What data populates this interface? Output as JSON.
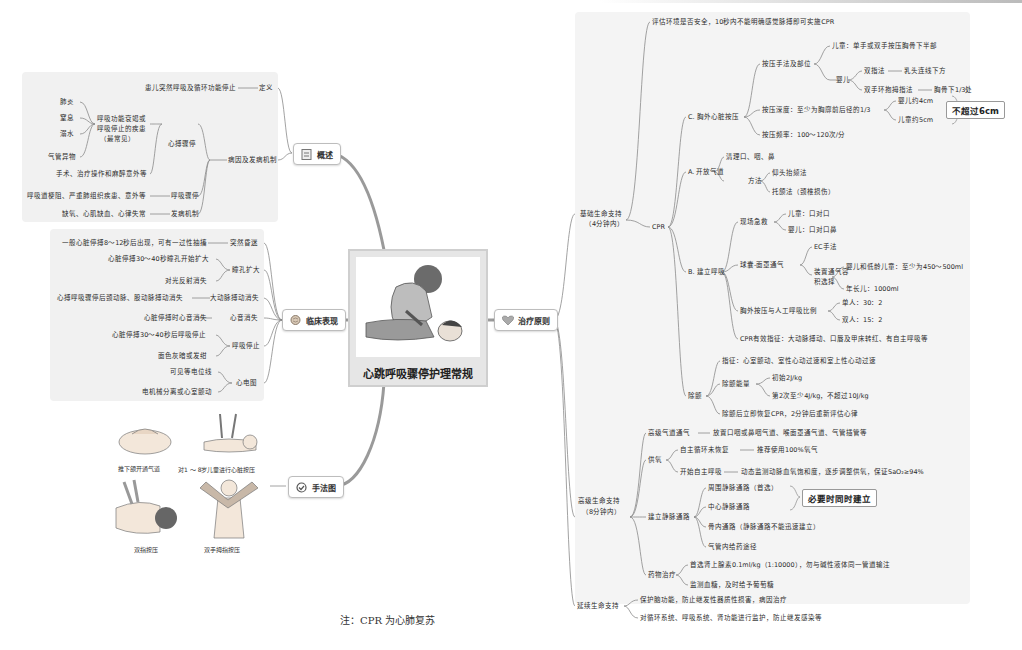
{
  "center": {
    "title": "心跳呼吸骤停护理常规",
    "image": "cpr-illustration"
  },
  "branches": {
    "overview": {
      "label": "概述",
      "icon": "document-icon",
      "definition": {
        "label": "定义",
        "text": "患儿突然呼吸及循环功能停止"
      },
      "etiology": {
        "label": "病因及发病机制",
        "cardiac_arrest": {
          "label": "心搏骤停",
          "group_label": [
            "呼吸功能衰竭或",
            "呼吸停止的疾患",
            "（最常见）"
          ],
          "items": [
            "肺炎",
            "窒息",
            "溺水",
            "气管异物"
          ],
          "other": "手术、治疗操作和麻醉意外等"
        },
        "respiratory_arrest": {
          "label": "呼吸骤停",
          "text": "呼吸道梗阻、严重肺组织疾患、意外等"
        },
        "mechanism": {
          "label": "发病机制",
          "text": "缺氧、心肌缺血、心律失常"
        }
      }
    },
    "clinical": {
      "label": "临床表现",
      "icon": "brain-icon",
      "items": [
        {
          "label": "突然昏迷",
          "children": [
            "一般心脏停搏8～12秒后出现，可有一过性抽搐"
          ]
        },
        {
          "label": "瞳孔扩大",
          "children": [
            "心脏停搏30～40秒瞳孔开始扩大",
            "对光反射消失"
          ]
        },
        {
          "label": "大动脉搏动消失",
          "children": [
            "心搏呼吸骤停后颈动脉、股动脉搏动消失"
          ]
        },
        {
          "label": "心音消失",
          "children": [
            "心脏停搏时心音消失"
          ]
        },
        {
          "label": "呼吸停止",
          "children": [
            "心脏停搏30～40秒后呼吸停止",
            "面色灰暗或发绀"
          ]
        },
        {
          "label": "心电图",
          "children": [
            "可见等电位线",
            "电机械分离或心室颤动"
          ]
        }
      ]
    },
    "diagrams": {
      "label": "手法图",
      "icon": "check-circle-icon",
      "figures": [
        "推下颌开通气道",
        "对1 ～ 8岁儿童进行心脏按压",
        "双指按压",
        "双手拇指按压"
      ]
    },
    "treatment": {
      "label": "治疗原则",
      "icon": "heart-icon",
      "bls": {
        "label": [
          "基础生命支持",
          "（4分钟内）"
        ],
        "assess": "评估环境是否安全，10秒内不能明确感觉脉搏即可实施CPR",
        "cpr": {
          "label": "CPR",
          "C": {
            "label": "C. 胸外心脏按压",
            "technique": {
              "label": "按压手法及部位",
              "child": "儿童：单手或双手按压胸骨下半部",
              "infant": {
                "label": "婴儿",
                "two_finger": {
                  "label": "双指法",
                  "text": "乳头连线下方"
                },
                "two_thumb": {
                  "label": "双手环抱拇指法",
                  "text": "胸骨下1/3处"
                }
              }
            },
            "depth": {
              "label": "按压深度：至少为胸廓前后径的1/3",
              "infant": "婴儿约4cm",
              "child": "儿童约5cm",
              "max": "不超过6cm"
            },
            "rate": "按压频率：100～120次/分"
          },
          "A": {
            "label": "A. 开放气道",
            "clear": "清理口、咽、鼻",
            "method": {
              "label": "方法",
              "items": [
                "仰头抬颏法",
                "托颌法（颈椎损伤）"
              ]
            }
          },
          "B": {
            "label": "B. 建立呼吸",
            "onsite": {
              "label": "现场急救",
              "items": [
                "儿童：口对口",
                "婴儿：口对口鼻"
              ]
            },
            "bag": {
              "label": "球囊-面罩通气",
              "ec": "EC手法",
              "volume": {
                "label": [
                  "装置通气容",
                  "积选择"
                ],
                "items": [
                  "婴儿和低龄儿童：至少为450～500ml",
                  "年长儿：1000ml"
                ]
              }
            },
            "ratio": {
              "label": "胸外按压与人工呼吸比例",
              "items": [
                "单人：30：2",
                "双人：15：2"
              ]
            },
            "effective": "CPR有效指征：大动脉搏动、口唇及甲床转红、有自主呼吸等"
          },
          "defib": {
            "label": "除颤",
            "indication": "指征：心室颤动、室性心动过速和室上性心动过速",
            "energy": {
              "label": "除颤能量",
              "items": [
                "初始2J/kg",
                "第2次至少4J/kg，不超过10J/kg"
              ]
            },
            "after": "除颤后立即恢复CPR，2分钟后重新评估心律"
          }
        }
      },
      "als": {
        "label": [
          "高级生命支持",
          "（8分钟内）"
        ],
        "airway": {
          "label": "高级气道通气",
          "text": "放置口咽或鼻咽气道、喉面罩通气道、气管插管等"
        },
        "oxygen": {
          "label": "供氧",
          "items": [
            {
              "label": "自主循环未恢复",
              "text": "推荐使用100%氧气"
            },
            {
              "label": "开始自主呼吸",
              "text": "动态监测动脉血氧饱和度，逐步调整供氧，保证SaO₂≥94%"
            }
          ]
        },
        "iv": {
          "label": "建立静脉通路",
          "items": [
            "周围静脉通路（首选）",
            "中心静脉通路",
            "骨内通路（静脉通路不能迅速建立）",
            "气管内给药途径"
          ],
          "note": "必要时同时建立"
        },
        "drugs": {
          "label": "药物治疗",
          "items": [
            "首选肾上腺素0.1ml/kg（1:10000），勿与碱性液体同一管道输注",
            "监测血糖，及时给予葡萄糖"
          ]
        }
      },
      "pls": {
        "label": "延续生命支持",
        "items": [
          "保护脑功能，防止继发性器质性损害，病因治疗",
          "对循环系统、呼吸系统、肾功能进行监护，防止继发感染等"
        ]
      }
    }
  },
  "footnote": "注：CPR 为心肺复苏"
}
